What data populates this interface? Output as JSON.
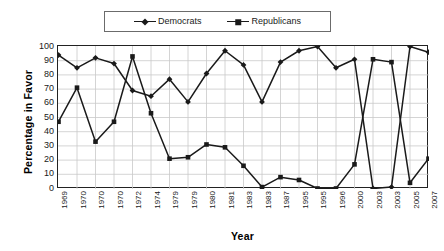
{
  "chart_data": {
    "type": "line",
    "title": "",
    "xlabel": "Year",
    "ylabel": "Percentage in Favor",
    "ylim": [
      0,
      100
    ],
    "ytick_step": 10,
    "yticks": [
      0,
      10,
      20,
      30,
      40,
      50,
      60,
      70,
      80,
      90,
      100
    ],
    "grid": true,
    "legend_position": "top-center",
    "categories": [
      "1969",
      "1970",
      "1970",
      "1970",
      "1972",
      "1974",
      "1979",
      "1979",
      "1980",
      "1981",
      "1983",
      "1983",
      "1987",
      "1995",
      "1995",
      "1996",
      "2000",
      "2003",
      "2003",
      "2005",
      "2007"
    ],
    "series": [
      {
        "name": "Democrats",
        "marker": "diamond",
        "color": "#1a1a1a",
        "values": [
          94,
          85,
          92,
          88,
          69,
          65,
          77,
          61,
          81,
          97,
          87,
          61,
          89,
          97,
          100,
          85,
          91,
          0,
          1,
          100,
          96
        ]
      },
      {
        "name": "Republicans",
        "marker": "square",
        "color": "#1a1a1a",
        "values": [
          47,
          71,
          33,
          47,
          93,
          53,
          21,
          22,
          31,
          29,
          16,
          1,
          8,
          6,
          0,
          0,
          17,
          91,
          89,
          4,
          21
        ]
      }
    ]
  },
  "legend": {
    "items": [
      {
        "label": "Democrats",
        "marker": "diamond-marker-icon"
      },
      {
        "label": "Republicans",
        "marker": "square-marker-icon"
      }
    ]
  },
  "axes": {
    "y_title": "Percentage in Favor",
    "x_title": "Year"
  }
}
